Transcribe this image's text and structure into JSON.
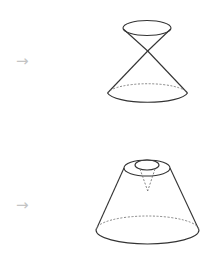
{
  "rows": [
    {
      "arrow": "→",
      "shape": "double-cone",
      "stroke_color": "#333333",
      "dash_color": "#777777"
    },
    {
      "arrow": "→",
      "shape": "truncated-cone-with-hole",
      "stroke_color": "#333333",
      "dash_color": "#777777"
    }
  ],
  "colors": {
    "arrow": "#c4c4c4",
    "background": "#ffffff"
  }
}
